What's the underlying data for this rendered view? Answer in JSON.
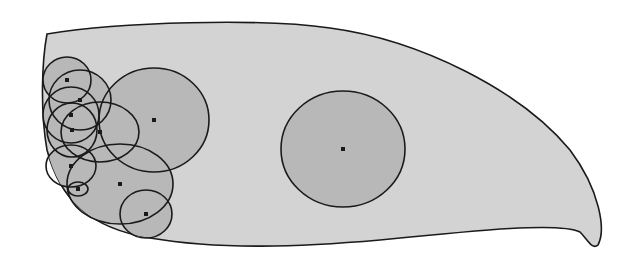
{
  "diagram": {
    "type": "circles-in-region",
    "colors": {
      "background": "#ffffff",
      "region_fill": "#d3d3d3",
      "circle_fill": "#b8b8b8",
      "stroke": "#1a1a1a",
      "center_dot": "#1a1a1a"
    },
    "region_path": "M47,34 C120,22 260,18 330,28 C420,40 520,90 570,150 C600,190 606,230 598,245 C592,250 588,240 580,232 C560,222 480,230 380,240 C300,247 220,250 150,238 C90,228 60,200 47,150 C40,110 42,60 47,34 Z",
    "circles": [
      {
        "cx": 154,
        "cy": 120,
        "rx": 55,
        "ry": 52
      },
      {
        "cx": 343,
        "cy": 149,
        "rx": 62,
        "ry": 58
      },
      {
        "cx": 67,
        "cy": 80,
        "rx": 24,
        "ry": 23
      },
      {
        "cx": 80,
        "cy": 100,
        "rx": 31,
        "ry": 30
      },
      {
        "cx": 71,
        "cy": 115,
        "rx": 28,
        "ry": 28
      },
      {
        "cx": 72,
        "cy": 130,
        "rx": 25,
        "ry": 27
      },
      {
        "cx": 100,
        "cy": 132,
        "rx": 39,
        "ry": 30
      },
      {
        "cx": 71,
        "cy": 166,
        "rx": 25,
        "ry": 21
      },
      {
        "cx": 78,
        "cy": 189,
        "rx": 10,
        "ry": 7
      },
      {
        "cx": 120,
        "cy": 184,
        "rx": 53,
        "ry": 40
      },
      {
        "cx": 146,
        "cy": 214,
        "rx": 26,
        "ry": 24
      }
    ]
  }
}
